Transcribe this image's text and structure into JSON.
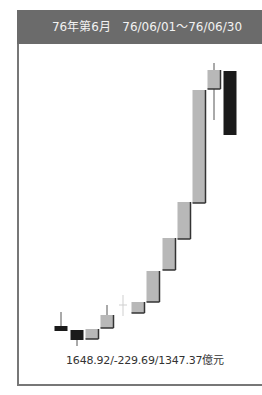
{
  "header": {
    "title": "76年第6月",
    "range": "76/06/01～76/06/30"
  },
  "caption": "1648.92/-229.69/1347.37億元",
  "colors": {
    "header_bg": "#6b6b6b",
    "up_body": "#b8b8b8",
    "down_body": "#1a1a1a",
    "shadow": "#333333"
  },
  "chart_data": {
    "type": "candlestick",
    "title": "76年第6月 76/06/01～76/06/30",
    "annotation": "1648.92/-229.69/1347.37億元",
    "grid": false,
    "candles": [
      {
        "x": 61,
        "open": 326,
        "close": 331,
        "high": 312,
        "low": 331,
        "color": "down"
      },
      {
        "x": 77,
        "open": 330,
        "close": 340,
        "high": 330,
        "low": 346,
        "color": "down"
      },
      {
        "x": 92,
        "open": 339,
        "close": 329,
        "high": 329,
        "low": 339,
        "color": "up"
      },
      {
        "x": 107,
        "open": 328,
        "close": 315,
        "high": 305,
        "low": 328,
        "color": "up"
      },
      {
        "x": 123,
        "open": 306,
        "close": 305,
        "high": 295,
        "low": 316,
        "color": "doji"
      },
      {
        "x": 138,
        "open": 313,
        "close": 302,
        "high": 302,
        "low": 313,
        "color": "up"
      },
      {
        "x": 153,
        "open": 302,
        "close": 271,
        "high": 271,
        "low": 302,
        "color": "up"
      },
      {
        "x": 169,
        "open": 270,
        "close": 238,
        "high": 238,
        "low": 270,
        "color": "up"
      },
      {
        "x": 184,
        "open": 239,
        "close": 202,
        "high": 202,
        "low": 239,
        "color": "up"
      },
      {
        "x": 199,
        "open": 203,
        "close": 90,
        "high": 90,
        "low": 203,
        "color": "up"
      },
      {
        "x": 214,
        "open": 89,
        "close": 70,
        "high": 63,
        "low": 120,
        "color": "up"
      },
      {
        "x": 230,
        "open": 71,
        "close": 135,
        "high": 71,
        "low": 135,
        "color": "down"
      }
    ],
    "note": "values are pixel-space y positions (smaller = higher); no axis ticks shown"
  }
}
